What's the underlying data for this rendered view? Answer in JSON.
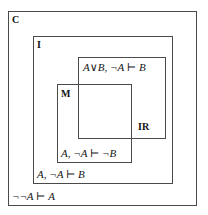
{
  "diagram": {
    "line_color": "#4a4a4a",
    "text_color": "#151515",
    "background": "#ffffff",
    "regions": [
      {
        "id": "C",
        "label": "C",
        "name": "classical-logic",
        "formula": "¬¬A ⊢ A"
      },
      {
        "id": "I",
        "label": "I",
        "name": "intuitionistic-logic",
        "formula": "A, ¬A ⊢ B"
      },
      {
        "id": "IR",
        "label": "IR",
        "name": "relevant-logic",
        "formula": "A∨B, ¬A ⊢ B"
      },
      {
        "id": "M",
        "label": "M",
        "name": "minimal-logic",
        "formula": "A, ¬A ⊢ ¬B"
      }
    ]
  }
}
